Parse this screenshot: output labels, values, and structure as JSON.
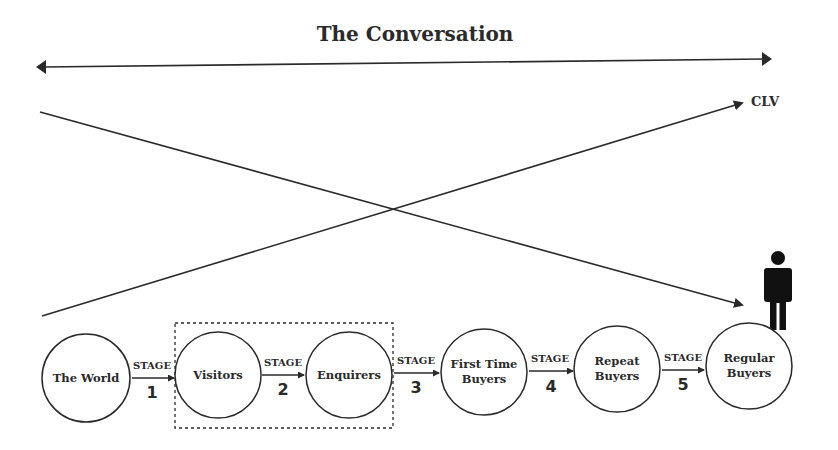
{
  "title": "The Conversation",
  "clv_label": "CLV",
  "stage_word": "STAGE",
  "colors": {
    "stroke": "#2a2a2a",
    "background": "#ffffff"
  },
  "nodes": [
    {
      "label_lines": [
        "The World"
      ],
      "cx": 86,
      "cy": 378
    },
    {
      "label_lines": [
        "Visitors"
      ],
      "cx": 218,
      "cy": 375
    },
    {
      "label_lines": [
        "Enquirers"
      ],
      "cx": 349,
      "cy": 375
    },
    {
      "label_lines": [
        "First Time",
        "Buyers"
      ],
      "cx": 484,
      "cy": 372
    },
    {
      "label_lines": [
        "Repeat",
        "Buyers"
      ],
      "cx": 617,
      "cy": 369
    },
    {
      "label_lines": [
        "Regular",
        "Buyers"
      ],
      "cx": 749,
      "cy": 366
    }
  ],
  "stages": [
    {
      "number": "1"
    },
    {
      "number": "2"
    },
    {
      "number": "3"
    },
    {
      "number": "4"
    },
    {
      "number": "5"
    }
  ],
  "highlight_group": [
    "Visitors",
    "Enquirers"
  ],
  "icons": {
    "person": "person-icon"
  }
}
